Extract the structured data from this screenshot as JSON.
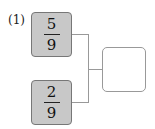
{
  "problem": {
    "label": "(1)",
    "fractions": [
      {
        "numerator": "5",
        "denominator": "9"
      },
      {
        "numerator": "2",
        "denominator": "9"
      }
    ],
    "answer_value": ""
  },
  "colors": {
    "box_fill": "#c8c8c8",
    "box_border": "#777777",
    "connector": "#999999"
  }
}
